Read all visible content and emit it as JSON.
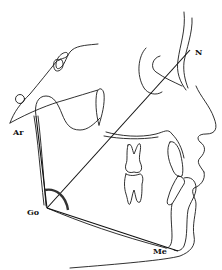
{
  "diagram": {
    "type": "cephalometric-tracing",
    "landmarks": [
      {
        "id": "N",
        "label": "N",
        "x": 190,
        "y": 50,
        "label_x": 195,
        "label_y": 55
      },
      {
        "id": "Ar",
        "label": "Ar",
        "x": 36,
        "y": 116,
        "label_x": 13,
        "label_y": 135
      },
      {
        "id": "Go",
        "label": "Go",
        "x": 47,
        "y": 208,
        "label_x": 28,
        "label_y": 214
      },
      {
        "id": "Me",
        "label": "Me",
        "x": 176,
        "y": 251,
        "label_x": 153,
        "label_y": 254
      }
    ],
    "lines": [
      {
        "name": "ar-go-ramus-line",
        "from": "Ar",
        "to": "Go"
      },
      {
        "name": "go-n-line",
        "from": "Go",
        "to": "N"
      },
      {
        "name": "go-me-mandibular-plane",
        "from": "Go",
        "to": "Me"
      }
    ],
    "angle_marker": {
      "vertex": "Go",
      "name": "gonial-angle"
    },
    "colors": {
      "stroke": "#1a1a1a",
      "angle": "#333333",
      "background": "#ffffff"
    }
  }
}
